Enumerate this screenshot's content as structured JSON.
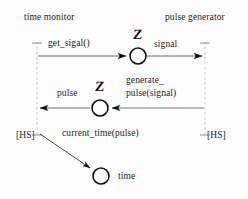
{
  "diagram": {
    "type": "uml-sequence-diagram",
    "canvas": {
      "width": 248,
      "height": 199,
      "background": "#fdfdfd"
    },
    "lifelines": [
      {
        "id": "time-monitor",
        "label": "time monitor",
        "x": 37,
        "top": 42,
        "bottom": 136,
        "terminator": "[HS]"
      },
      {
        "id": "pulse-generator",
        "label": "pulse generator",
        "x": 205,
        "top": 42,
        "bottom": 136,
        "terminator": "[HS]"
      }
    ],
    "headers": {
      "left": "time monitor",
      "right": "pulse generator"
    },
    "terminators": {
      "left": "[HS]",
      "right": "[HS]"
    },
    "messages": [
      {
        "id": "msg-get-signal",
        "label": "get_sigal()",
        "from": "time-monitor",
        "to": "state-signal",
        "direction": "right",
        "y": 56
      },
      {
        "id": "msg-signal",
        "label": "signal",
        "from": "state-signal",
        "to": "pulse-generator",
        "direction": "right",
        "y": 56
      },
      {
        "id": "msg-pulse",
        "label": "pulse",
        "from": "state-pulse",
        "to": "time-monitor",
        "direction": "left",
        "y": 108
      },
      {
        "id": "msg-generate-pulse",
        "label_line1": "generate_",
        "label_line2": "pulse(signal)",
        "from": "pulse-generator",
        "to": "state-pulse",
        "direction": "left",
        "y": 108
      },
      {
        "id": "msg-current-time",
        "label": "current_time(pulse)",
        "from": "time-monitor",
        "to": "state-time",
        "direction": "down-right"
      }
    ],
    "states": [
      {
        "id": "state-signal",
        "glyph": "Z",
        "cx": 138,
        "cy": 56,
        "r": 8
      },
      {
        "id": "state-pulse",
        "glyph": "Z",
        "cx": 100,
        "cy": 108,
        "r": 8
      },
      {
        "id": "state-time",
        "glyph": "",
        "label": "time",
        "cx": 101,
        "cy": 176,
        "r": 8
      }
    ],
    "colors": {
      "stroke": "#1a1a1a",
      "lifeline": "#b9b9b9",
      "text": "#1d1d1d",
      "background": "#fdfdfd"
    }
  }
}
